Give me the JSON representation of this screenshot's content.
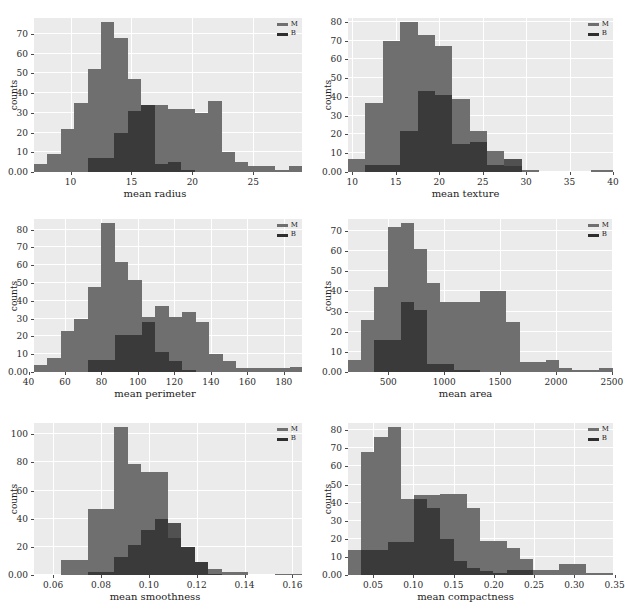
{
  "figure": {
    "type": "histogram-grid",
    "rows": 3,
    "cols": 2,
    "legend_labels": [
      "M",
      "B"
    ],
    "colors": {
      "M": "#6f6f6f",
      "B": "#2e2e2e",
      "axes_background": "#ebebeb",
      "gridline": "#ffffff",
      "page_background": "#ffffff"
    },
    "shared_ylabel": "counts"
  },
  "chart_data": [
    {
      "type": "bar",
      "id": "mean-radius",
      "title": "",
      "xlabel": "mean radius",
      "ylabel": "counts",
      "xlim": [
        7.0,
        29.0
      ],
      "ylim": [
        0,
        78
      ],
      "xticks": [
        10,
        15,
        20,
        25
      ],
      "yticks": [
        0,
        10,
        20,
        30,
        40,
        50,
        60,
        70
      ],
      "grid": true,
      "legend_position": "upper right",
      "bin_edges": [
        7.0,
        8.1,
        9.2,
        10.3,
        11.4,
        12.5,
        13.6,
        14.7,
        15.8,
        16.9,
        18.0,
        19.1,
        20.2,
        21.3,
        22.4,
        23.5,
        24.6,
        25.7,
        26.8,
        27.9,
        29.0
      ],
      "series": [
        {
          "name": "M",
          "values": [
            4,
            9,
            22,
            35,
            52,
            76,
            68,
            47,
            34,
            34,
            32,
            32,
            30,
            36,
            10,
            5,
            3,
            3,
            1,
            3
          ]
        },
        {
          "name": "B",
          "values": [
            0,
            0,
            0,
            0,
            7,
            7,
            20,
            31,
            34,
            4,
            5,
            1,
            0,
            0,
            0,
            0,
            0,
            0,
            0,
            0
          ]
        }
      ]
    },
    {
      "type": "bar",
      "id": "mean-texture",
      "title": "",
      "xlabel": "mean texture",
      "ylabel": "counts",
      "xlim": [
        9.5,
        40.0
      ],
      "ylim": [
        0,
        82
      ],
      "xticks": [
        10,
        15,
        20,
        25,
        30,
        35,
        40
      ],
      "yticks": [
        0,
        10,
        20,
        30,
        40,
        50,
        60,
        70,
        80
      ],
      "grid": true,
      "legend_position": "upper right",
      "bin_edges": [
        9.5,
        11.5,
        13.5,
        15.5,
        17.5,
        19.5,
        21.5,
        23.5,
        25.5,
        27.5,
        29.5,
        31.5,
        33.5,
        35.5,
        37.5,
        40.0
      ],
      "series": [
        {
          "name": "M",
          "values": [
            7,
            37,
            70,
            80,
            73,
            67,
            39,
            22,
            11,
            3,
            1,
            0,
            0,
            0,
            1
          ]
        },
        {
          "name": "B",
          "values": [
            0,
            4,
            4,
            22,
            43,
            41,
            15,
            16,
            4,
            7,
            0,
            0,
            0,
            0,
            0
          ]
        }
      ]
    },
    {
      "type": "bar",
      "id": "mean-perimeter",
      "title": "",
      "xlabel": "mean perimeter",
      "ylabel": "counts",
      "xlim": [
        43.0,
        190.0
      ],
      "ylim": [
        0,
        86
      ],
      "xticks": [
        40,
        60,
        80,
        100,
        120,
        140,
        160,
        180
      ],
      "yticks": [
        0,
        10,
        20,
        30,
        40,
        50,
        60,
        70,
        80
      ],
      "grid": true,
      "legend_position": "upper right",
      "bin_edges": [
        43.0,
        50.4,
        57.8,
        65.2,
        72.6,
        80.0,
        87.4,
        94.8,
        102.2,
        109.6,
        117.0,
        124.4,
        131.8,
        139.2,
        146.6,
        154.0,
        161.4,
        168.8,
        176.2,
        183.6,
        190.0
      ],
      "series": [
        {
          "name": "M",
          "values": [
            4,
            8,
            23,
            30,
            48,
            84,
            62,
            52,
            31,
            37,
            31,
            34,
            28,
            10,
            6,
            2,
            2,
            2,
            2,
            3
          ]
        },
        {
          "name": "B",
          "values": [
            0,
            0,
            0,
            0,
            7,
            7,
            21,
            21,
            28,
            11,
            6,
            1,
            0,
            0,
            0,
            0,
            0,
            0,
            0,
            0
          ]
        }
      ]
    },
    {
      "type": "bar",
      "id": "mean-area",
      "title": "",
      "xlabel": "mean area",
      "ylabel": "counts",
      "xlim": [
        140.0,
        2510.0
      ],
      "ylim": [
        0,
        76
      ],
      "xticks": [
        500,
        1000,
        1500,
        2000,
        2500
      ],
      "yticks": [
        0,
        10,
        20,
        30,
        40,
        50,
        60,
        70
      ],
      "grid": true,
      "legend_position": "upper right",
      "bin_edges": [
        140,
        258,
        376,
        494,
        612,
        730,
        848,
        966,
        1084,
        1202,
        1320,
        1438,
        1556,
        1674,
        1792,
        1910,
        2028,
        2146,
        2264,
        2382,
        2510
      ],
      "series": [
        {
          "name": "M",
          "values": [
            6,
            26,
            42,
            72,
            74,
            61,
            44,
            35,
            35,
            35,
            40,
            40,
            25,
            5,
            5,
            6,
            2,
            1,
            1,
            2
          ]
        },
        {
          "name": "B",
          "values": [
            0,
            0,
            16,
            16,
            35,
            31,
            4,
            4,
            1,
            1,
            0,
            0,
            0,
            0,
            0,
            0,
            0,
            0,
            0,
            0
          ]
        }
      ]
    },
    {
      "type": "bar",
      "id": "mean-smoothness",
      "title": "",
      "xlabel": "mean smoothness",
      "ylabel": "counts",
      "xlim": [
        0.052,
        0.164
      ],
      "ylim": [
        0,
        108
      ],
      "xticks": [
        0.06,
        0.08,
        0.1,
        0.12,
        0.14,
        0.16
      ],
      "xtick_labels": [
        "0.06",
        "0.08",
        "0.10",
        "0.12",
        "0.14",
        "0.16"
      ],
      "yticks": [
        0,
        20,
        40,
        60,
        80,
        100
      ],
      "grid": true,
      "legend_position": "upper right",
      "bin_edges": [
        0.052,
        0.0576,
        0.0632,
        0.0688,
        0.0744,
        0.08,
        0.0856,
        0.0912,
        0.0968,
        0.1024,
        0.108,
        0.1136,
        0.1192,
        0.1248,
        0.1304,
        0.136,
        0.1416,
        0.1472,
        0.1528,
        0.1584,
        0.164
      ],
      "series": [
        {
          "name": "M",
          "values": [
            0,
            0,
            11,
            11,
            47,
            47,
            105,
            79,
            73,
            73,
            26,
            20,
            9,
            4,
            2,
            2,
            0,
            0,
            1,
            1
          ]
        },
        {
          "name": "B",
          "values": [
            0,
            0,
            0,
            0,
            2,
            2,
            13,
            21,
            32,
            40,
            37,
            20,
            9,
            1,
            0,
            0,
            0,
            0,
            0,
            0
          ]
        }
      ]
    },
    {
      "type": "bar",
      "id": "mean-compactness",
      "title": "",
      "xlabel": "mean compactness",
      "ylabel": "counts",
      "xlim": [
        0.019,
        0.348
      ],
      "ylim": [
        0,
        84
      ],
      "xticks": [
        0.05,
        0.1,
        0.15,
        0.2,
        0.25,
        0.3,
        0.35
      ],
      "xtick_labels": [
        "0.05",
        "0.10",
        "0.15",
        "0.20",
        "0.25",
        "0.30",
        "0.35"
      ],
      "yticks": [
        0,
        10,
        20,
        30,
        40,
        50,
        60,
        70,
        80
      ],
      "grid": true,
      "legend_position": "upper right",
      "bin_edges": [
        0.019,
        0.0354,
        0.0518,
        0.0682,
        0.0846,
        0.101,
        0.1174,
        0.1338,
        0.1502,
        0.1666,
        0.183,
        0.1994,
        0.2158,
        0.2322,
        0.2486,
        0.265,
        0.2814,
        0.2978,
        0.3142,
        0.3306,
        0.348
      ],
      "series": [
        {
          "name": "M",
          "values": [
            14,
            68,
            76,
            82,
            42,
            44,
            44,
            45,
            45,
            37,
            19,
            19,
            15,
            9,
            3,
            3,
            6,
            6,
            1,
            1
          ]
        },
        {
          "name": "B",
          "values": [
            0,
            14,
            14,
            18,
            18,
            42,
            37,
            20,
            8,
            4,
            2,
            1,
            3,
            3,
            0,
            0,
            0,
            0,
            0,
            0
          ]
        }
      ]
    }
  ]
}
